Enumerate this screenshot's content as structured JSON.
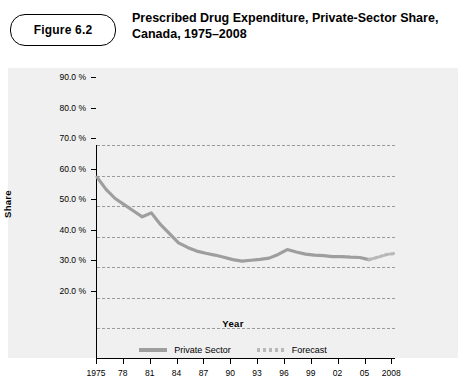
{
  "figure": {
    "label": "Figure 6.2",
    "title": "Prescribed Drug Expenditure, Private-Sector Share, Canada, 1975–2008"
  },
  "chart_data": {
    "type": "line",
    "title": "Prescribed Drug Expenditure, Private-Sector Share, Canada, 1975–2008",
    "xlabel": "Year",
    "ylabel": "Share",
    "ylim": [
      20,
      90
    ],
    "yticks": [
      "20.0 %",
      "30.0 %",
      "40.0 %",
      "50.0 %",
      "60.0 %",
      "70.0 %",
      "80.0 %",
      "90.0 %"
    ],
    "xticks": [
      "1975",
      "78",
      "81",
      "84",
      "87",
      "90",
      "93",
      "96",
      "99",
      "02",
      "05",
      "2008"
    ],
    "grid": true,
    "legend_position": "bottom",
    "series": [
      {
        "name": "Private Sector",
        "color": "#9e9e9e",
        "style": "solid",
        "x": [
          1975,
          1976,
          1977,
          1978,
          1979,
          1980,
          1981,
          1982,
          1983,
          1984,
          1985,
          1986,
          1987,
          1988,
          1989,
          1990,
          1991,
          1992,
          1993,
          1994,
          1995,
          1996,
          1997,
          1998,
          1999,
          2000,
          2001,
          2002,
          2003,
          2004,
          2005
        ],
        "values": [
          79.5,
          75.5,
          72.5,
          70.5,
          68.5,
          66.5,
          67.8,
          64.0,
          61.0,
          58.0,
          56.5,
          55.3,
          54.6,
          54.0,
          53.3,
          52.5,
          52.0,
          52.3,
          52.6,
          53.0,
          54.2,
          55.8,
          55.0,
          54.3,
          54.0,
          53.8,
          53.5,
          53.5,
          53.3,
          53.2,
          52.5
        ]
      },
      {
        "name": "Forecast",
        "color": "#b8b8b8",
        "style": "dashed",
        "x": [
          2005,
          2006,
          2007,
          2008
        ],
        "values": [
          52.5,
          53.3,
          54.2,
          54.6
        ]
      }
    ]
  },
  "legend": [
    {
      "label": "Private Sector",
      "swatch": "solid-line-swatch"
    },
    {
      "label": "Forecast",
      "swatch": "dashed-line-swatch"
    }
  ]
}
